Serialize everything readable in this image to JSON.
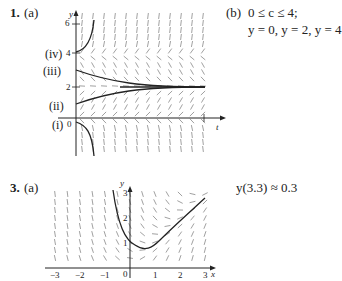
{
  "problem1": {
    "number": "1.",
    "part_a": "(a)",
    "part_b": "(b)",
    "answer_b_line1": "0 ≤ c ≤ 4;",
    "answer_b_line2": "y = 0, y = 2, y = 4",
    "curve_labels": [
      "(iv)",
      "(iii)",
      "(ii)",
      "(i)"
    ],
    "y_axis_label": "y",
    "x_axis_label": "t",
    "y_ticks": [
      "6",
      "4",
      "2",
      "0"
    ]
  },
  "problem3": {
    "number": "3.",
    "part_a": "(a)",
    "answer": "y(3.3) ≈ 0.3",
    "y_axis_label": "y",
    "x_axis_label": "x",
    "x_ticks": [
      "−3",
      "−2",
      "−1",
      "0",
      "1",
      "2",
      "3"
    ],
    "y_ticks": [
      "3",
      "2",
      "1"
    ]
  },
  "chart_data": [
    {
      "type": "line",
      "title": "Direction field with solution curves (Problem 1a)",
      "xlabel": "t",
      "ylabel": "y",
      "ylim": [
        -1.5,
        6.5
      ],
      "y_ticks": [
        0,
        2,
        4,
        6
      ],
      "equilibria": [
        0,
        2,
        4
      ],
      "series": [
        {
          "name": "(i)",
          "initial_y": 0,
          "behavior": "decreases rapidly to -infinity"
        },
        {
          "name": "(ii)",
          "initial_y": 1,
          "behavior": "increases to 2"
        },
        {
          "name": "(iii)",
          "initial_y": 3,
          "behavior": "decreases to 2"
        },
        {
          "name": "(iv)",
          "initial_y": 4,
          "behavior": "increases rapidly to infinity"
        }
      ]
    },
    {
      "type": "line",
      "title": "Direction field with solution curve (Problem 3a)",
      "xlabel": "x",
      "ylabel": "y",
      "xlim": [
        -3,
        3
      ],
      "ylim": [
        0,
        3
      ],
      "x_ticks": [
        -3,
        -2,
        -1,
        0,
        1,
        2,
        3
      ],
      "y_ticks": [
        1,
        2,
        3
      ],
      "series": [
        {
          "name": "solution",
          "x": [
            -0.6,
            -0.4,
            -0.2,
            0,
            0.3,
            0.6,
            1.0,
            1.5,
            2.0,
            2.5,
            3.0
          ],
          "y": [
            3.0,
            2.2,
            1.6,
            1.15,
            0.85,
            0.75,
            0.85,
            1.3,
            1.8,
            2.35,
            2.8
          ]
        }
      ]
    }
  ]
}
